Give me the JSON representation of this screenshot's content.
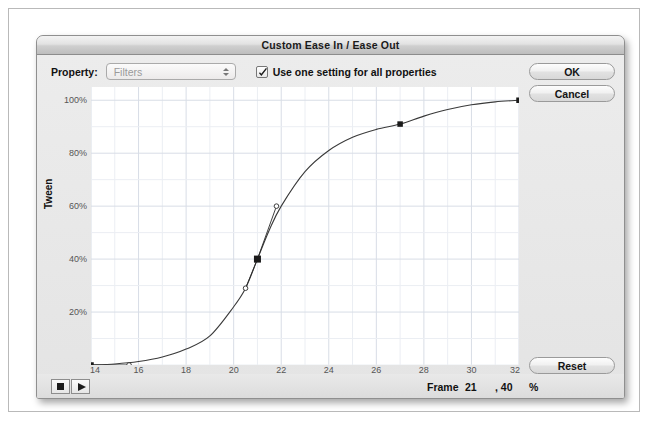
{
  "window": {
    "title": "Custom Ease In / Ease Out"
  },
  "toolbar": {
    "property_label": "Property:",
    "property_value": "Filters",
    "property_options": [
      "Filters"
    ],
    "checkbox_label": "Use one setting for all properties",
    "checkbox_checked": true
  },
  "buttons": {
    "ok": "OK",
    "cancel": "Cancel",
    "reset": "Reset"
  },
  "transport": {
    "stop": "stop-button",
    "play": "play-button"
  },
  "readout": {
    "frame_label": "Frame",
    "frame_value": "21",
    "percent_value": ", 40",
    "percent_sign": "%"
  },
  "colors": {
    "grid_major": "#d8dde6",
    "grid_minor": "#ebeef3",
    "curve": "#3a3a3a",
    "point": "#1a1a1a",
    "plot_bg": "#ffffff",
    "dialog_bg": "#ececec",
    "titlebar": "#d6d6d6"
  },
  "chart_data": {
    "type": "line",
    "title": "Custom Ease In / Ease Out",
    "xlabel": "Frames",
    "ylabel": "Tween",
    "xlim": [
      14,
      32
    ],
    "ylim": [
      0,
      105
    ],
    "grid": true,
    "legend": null,
    "x_ticks": [
      14,
      16,
      18,
      20,
      22,
      24,
      26,
      28,
      30,
      32
    ],
    "x_tick_labels": [
      "14",
      "16",
      "18",
      "20",
      "22",
      "24",
      "26",
      "28",
      "30",
      "32"
    ],
    "y_ticks": [
      20,
      40,
      60,
      80,
      100
    ],
    "y_tick_labels": [
      "20%",
      "40%",
      "60%",
      "80%",
      "100%"
    ],
    "x_minor_step": 1,
    "y_minor_step": 10,
    "curve_name": "ease-in-out-spline",
    "control_points": [
      {
        "frame": 14,
        "percent": 0,
        "selected": false
      },
      {
        "frame": 21,
        "percent": 40,
        "selected": true
      },
      {
        "frame": 27,
        "percent": 91,
        "selected": false
      },
      {
        "frame": 32,
        "percent": 100,
        "selected": false
      }
    ],
    "bezier_handles": [
      {
        "owner_frame": 14,
        "frame": 15.6,
        "percent": 0
      },
      {
        "owner_frame": 21,
        "frame": 20.5,
        "percent": 29
      },
      {
        "owner_frame": 21,
        "frame": 21.8,
        "percent": 60
      }
    ],
    "series": [
      {
        "name": "tween",
        "x": [
          14,
          15,
          16,
          17,
          18,
          19,
          20,
          20.5,
          21,
          21.5,
          22,
          23,
          24,
          25,
          26,
          27,
          28,
          29,
          30,
          31,
          32
        ],
        "values": [
          0,
          0.4,
          1.3,
          3,
          6,
          11,
          22,
          29,
          40,
          51,
          60,
          73,
          81,
          86,
          89,
          91,
          94,
          96.5,
          98.3,
          99.4,
          100
        ]
      }
    ]
  }
}
